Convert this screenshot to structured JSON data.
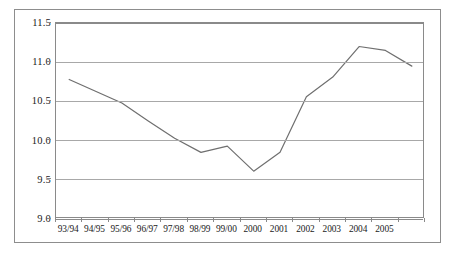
{
  "chart_data": {
    "type": "line",
    "title": "",
    "subtitle": "",
    "xlabel": "",
    "ylabel": "",
    "categories": [
      "93/94",
      "94/95",
      "95/96",
      "96/97",
      "97/98",
      "98/99",
      "99/00",
      "2000",
      "2001",
      "2002",
      "2003",
      "2004",
      "2005",
      ""
    ],
    "x_tick_labels": [
      "93/94",
      "94/95",
      "95/96",
      "96/97",
      "97/98",
      "98/99",
      "99/00",
      "2000",
      "2001",
      "2002",
      "2003",
      "2004",
      "2005"
    ],
    "y_tick_labels": [
      "9.0",
      "9.5",
      "10.0",
      "10.5",
      "11.0",
      "11.5"
    ],
    "y_ticks": [
      9.0,
      9.5,
      10.0,
      10.5,
      11.0,
      11.5
    ],
    "ylim": [
      9.0,
      11.5
    ],
    "values": [
      10.78,
      10.63,
      10.48,
      10.25,
      10.03,
      9.85,
      9.93,
      9.61,
      9.85,
      10.56,
      10.81,
      11.2,
      11.15,
      10.95
    ],
    "series": [
      {
        "name": "series-1",
        "color": "#6f6f6f",
        "values": [
          10.78,
          10.63,
          10.48,
          10.25,
          10.03,
          9.85,
          9.93,
          9.61,
          9.85,
          10.56,
          10.81,
          11.2,
          11.15,
          10.95
        ]
      }
    ],
    "grid": true,
    "grid_axis": "y",
    "legend": false,
    "legend_position": "none",
    "markers": false,
    "line_width": 1.2
  },
  "style": {
    "line_color": "#6f6f6f",
    "grid_color": "#a8a8a8",
    "axis_color": "#8a8a8a",
    "frame_color": "#8d8d8d",
    "background": "#ffffff",
    "text_color": "#1a1a1a"
  }
}
